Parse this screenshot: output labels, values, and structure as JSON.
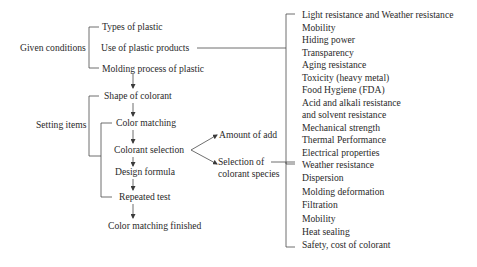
{
  "diagram": {
    "given_conditions": {
      "label": "Given conditions",
      "items": [
        "Types of plastic",
        "Use of plastic products",
        "Molding process of plastic"
      ]
    },
    "product_requirements": [
      "Light resistance and Weather resistance",
      "Mobility",
      "Hiding power",
      "Transparency",
      "Aging resistance",
      "Toxicity (heavy metal)",
      "Food Hygiene (FDA)",
      "Acid and alkali resistance",
      "and solvent resistance",
      "Mechanical strength",
      "Thermal Performance",
      "Electrical properties"
    ],
    "setting_items": {
      "label": "Setting items",
      "shape": "Shape of colorant",
      "steps": [
        "Color matching",
        "Colorant selection",
        "Design formula",
        "Repeated test"
      ],
      "finish": "Color matching finished"
    },
    "colorant_selection_branches": {
      "amount": "Amount of add",
      "species_line1": "Selection of",
      "species_line2": "colorant species"
    },
    "species_criteria": [
      "Weather resistance",
      "Dispersion",
      "Molding deformation",
      "Filtration",
      "Mobility",
      "Heat sealing",
      "Safety, cost of colorant"
    ]
  }
}
